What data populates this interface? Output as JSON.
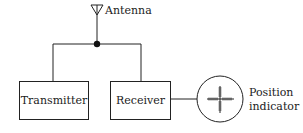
{
  "diagram": {
    "type": "block-diagram",
    "title": "",
    "colors": {
      "stroke": "#222222",
      "background": "#ffffff"
    },
    "antenna": {
      "label": "Antenna",
      "icon": "antenna-icon"
    },
    "blocks": [
      {
        "id": "transmitter",
        "label": "Transmitter"
      },
      {
        "id": "receiver",
        "label": "Receiver"
      }
    ],
    "indicator": {
      "label_line1": "Position",
      "label_line2": "indicator",
      "icon": "crosshair-scope-icon"
    },
    "connections": [
      {
        "from": "antenna",
        "to": "junction"
      },
      {
        "from": "junction",
        "to": "transmitter"
      },
      {
        "from": "junction",
        "to": "receiver"
      },
      {
        "from": "receiver",
        "to": "indicator"
      }
    ]
  }
}
